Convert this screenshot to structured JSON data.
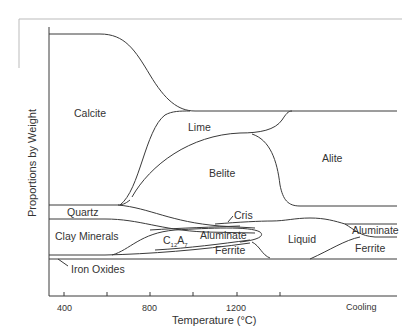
{
  "diagram": {
    "type": "phase-evolution",
    "y_axis_label": "Proportions by Weight",
    "x_axis_label": "Temperature (°C)",
    "x_ticks": [
      "400",
      "800",
      "1200",
      "Cooling"
    ],
    "regions": {
      "calcite": "Calcite",
      "lime": "Lime",
      "belite": "Belite",
      "alite": "Alite",
      "quartz": "Quartz",
      "cris": "Cris",
      "clay": "Clay Minerals",
      "c12a7_base": "C",
      "c12a7_sub1": "12",
      "c12a7_mid": "A",
      "c12a7_sub2": "7",
      "aluminate1": "Aluminate",
      "ferrite1": "Ferrite",
      "liquid": "Liquid",
      "aluminate2": "Aluminate",
      "ferrite2": "Ferrite",
      "iron_oxides": "Iron Oxides"
    }
  }
}
